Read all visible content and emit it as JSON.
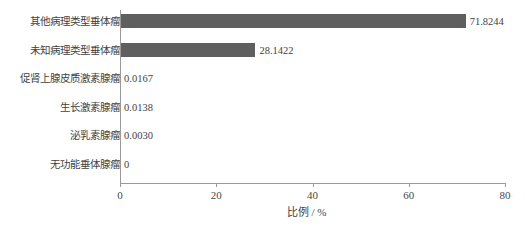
{
  "chart_data": {
    "type": "bar",
    "orientation": "horizontal",
    "title": "",
    "xlabel": "比例 / %",
    "ylabel": "",
    "xlim": [
      0,
      80
    ],
    "xticks": [
      0,
      20,
      40,
      60,
      80
    ],
    "xtick_labels": [
      "0",
      "20",
      "40",
      "60",
      "80"
    ],
    "grid": false,
    "legend": false,
    "bar_color": "#5f5f5f",
    "axis_color": "#9a9a9a",
    "text_color": "#3f3f3f",
    "background": "#ffffff",
    "categories": [
      "其他病理类型垂体瘤",
      "未知病理类型垂体瘤",
      "促肾上腺皮质激素腺瘤",
      "生长激素腺瘤",
      "泌乳素腺瘤",
      "无功能垂体腺瘤"
    ],
    "values": [
      71.8244,
      28.1422,
      0.0167,
      0.0138,
      0.003,
      0
    ],
    "value_labels": [
      "71.8244",
      "28.1422",
      "0.0167",
      "0.0138",
      "0.0030",
      "0"
    ]
  }
}
